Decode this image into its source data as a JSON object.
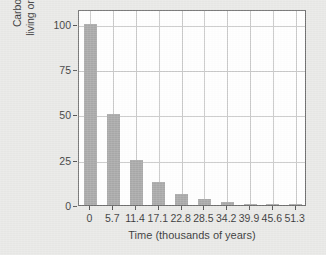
{
  "chart_data": {
    "type": "bar",
    "title": "",
    "xlabel": "Time (thousands of years)",
    "ylabel_line1": "Carbon-14 radioactivity (as % of",
    "ylabel_line2": "living organism's C-14 to C-12 ratio)",
    "categories": [
      "0",
      "5.7",
      "11.4",
      "17.1",
      "22.8",
      "28.5",
      "34.2",
      "39.9",
      "45.6",
      "51.3"
    ],
    "values": [
      100,
      50,
      25,
      12.5,
      6.25,
      3.125,
      1.5625,
      0.78125,
      0.390625,
      0.1953125
    ],
    "xtick_labels": [
      "0",
      "5.7",
      "11.4",
      "17.1",
      "22.8",
      "28.5",
      "34.2",
      "39.9",
      "45.6",
      "51.3"
    ],
    "ytick_labels": [
      "100",
      "75",
      "50",
      "25",
      "0"
    ],
    "ytick_values": [
      100,
      75,
      50,
      25,
      0
    ],
    "ylim": [
      0,
      108
    ],
    "xlim": [
      -0.7,
      9.7
    ],
    "grid": true,
    "legend": "none",
    "bar_color": "#a9a9a9",
    "plot_background": "#ffffff",
    "figure_background": "#e9e9e7",
    "grid_color": "#c9c9c9",
    "axis_color": "#6f6f6f",
    "text_color": "#3b3b3b"
  }
}
